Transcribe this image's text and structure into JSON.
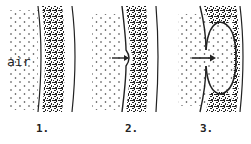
{
  "diagram": {
    "air_label": "air",
    "panels": [
      {
        "number": "1.",
        "stage": "flat-wall"
      },
      {
        "number": "2.",
        "stage": "small-indentation"
      },
      {
        "number": "3.",
        "stage": "deep-invagination"
      }
    ],
    "colors": {
      "ink": "#222222",
      "background": "#ffffff"
    }
  }
}
